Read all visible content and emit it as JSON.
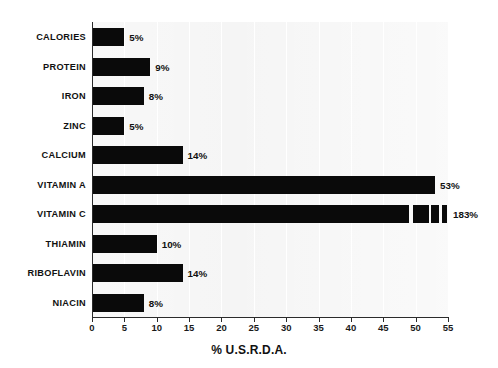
{
  "chart_data": {
    "type": "bar",
    "orientation": "horizontal",
    "title": "",
    "xlabel": "% U.S.R.D.A.",
    "ylabel": "",
    "xlim": [
      0,
      55
    ],
    "xticks": [
      0,
      5,
      10,
      15,
      20,
      25,
      30,
      35,
      40,
      45,
      50,
      55
    ],
    "xtick_labels": [
      "0",
      "5",
      "10",
      "15",
      "20",
      "25",
      "30",
      "35",
      "40",
      "45",
      "50",
      "55"
    ],
    "grid": true,
    "grid_axis": "x",
    "legend": false,
    "categories": [
      "CALORIES",
      "PROTEIN",
      "IRON",
      "ZINC",
      "CALCIUM",
      "VITAMIN A",
      "VITAMIN C",
      "THIAMIN",
      "RIBOFLAVIN",
      "NIACIN"
    ],
    "values": [
      5,
      9,
      8,
      5,
      14,
      53,
      183,
      10,
      14,
      8
    ],
    "value_labels": [
      "5%",
      "9%",
      "8%",
      "5%",
      "14%",
      "53%",
      "183%",
      "10%",
      "14%",
      "8%"
    ],
    "colors": {
      "bar": "#0a0a0a",
      "plot_background": "#f0f0f0",
      "gridline": "#ffffff",
      "axis": "#2b2b2b",
      "text": "#111111",
      "page_background": "#ffffff"
    }
  }
}
